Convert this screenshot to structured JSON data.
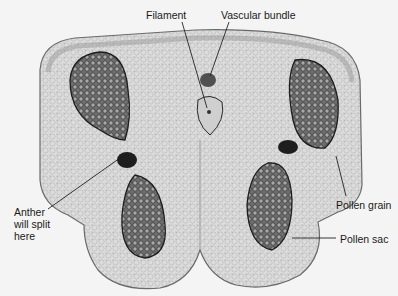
{
  "figure": {
    "labels": {
      "filament": "Filament",
      "vascular_bundle": "Vascular bundle",
      "anther_split": "Anther\nwill split\nhere",
      "pollen_grain": "Pollen grain",
      "pollen_sac": "Pollen sac"
    },
    "colors": {
      "background": "#f4f4f4",
      "tissue": "#d9d9d9",
      "tissue_edge": "#6a6a6a",
      "pollen": "#5a5a5a",
      "pollen_dark": "#2e2e2e",
      "leader_line": "#222222"
    }
  }
}
